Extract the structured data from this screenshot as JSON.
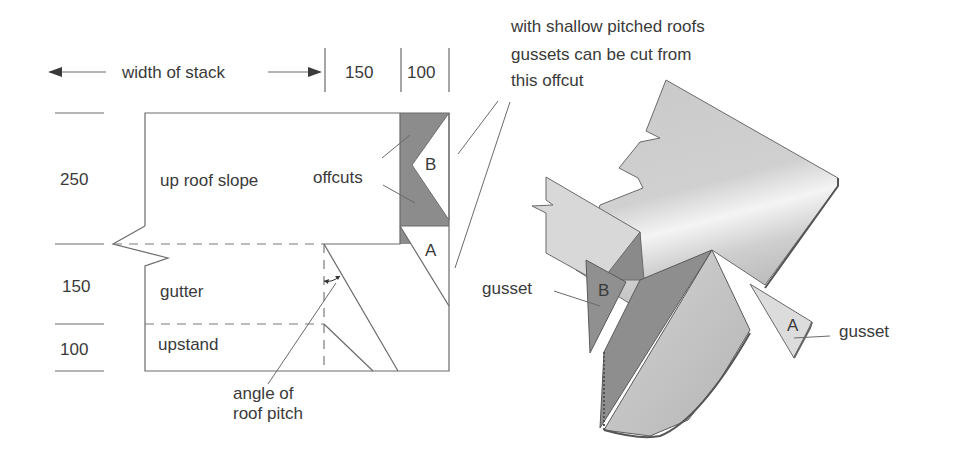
{
  "header": {
    "width_label": "width of stack",
    "dim_150": "150",
    "dim_100": "100"
  },
  "left_dims": {
    "d250": "250",
    "d150": "150",
    "d100": "100"
  },
  "flat_layout": {
    "up_roof_slope": "up roof slope",
    "offcuts": "offcuts",
    "gutter": "gutter",
    "upstand": "upstand",
    "piece_b": "B",
    "piece_a": "A",
    "angle_label_line1": "angle of",
    "angle_label_line2": "roof pitch"
  },
  "note": {
    "line1": "with shallow pitched roofs",
    "line2": "gussets can be cut from",
    "line3": "this offcut"
  },
  "assembled": {
    "gusset_b_label": "gusset",
    "gusset_a_label": "gusset",
    "piece_b": "B",
    "piece_a": "A"
  },
  "colors": {
    "offcut_fill": "#8c8c8c",
    "sheet_light": "#d9d9d9",
    "sheet_mid": "#bdbdbd",
    "sheet_dark": "#8a8a8a",
    "line": "#6a6a6a",
    "text": "#3a3a3a"
  }
}
